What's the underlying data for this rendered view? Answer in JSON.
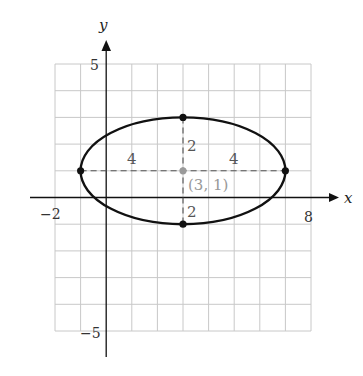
{
  "figure": {
    "type": "ellipse-on-grid",
    "axes": {
      "x_label": "x",
      "y_label": "y",
      "x_range": [
        -2,
        8
      ],
      "y_range": [
        -5,
        5
      ],
      "grid_step": 1
    },
    "tick_labels": {
      "x_min": "−2",
      "x_max": "8",
      "y_max": "5",
      "y_min": "−5"
    },
    "ellipse": {
      "center": [
        3,
        1
      ],
      "semi_major_horizontal": 4,
      "semi_minor_vertical": 2,
      "vertices": [
        [
          -1,
          1
        ],
        [
          7,
          1
        ]
      ],
      "co_vertices": [
        [
          3,
          3
        ],
        [
          3,
          -1
        ]
      ]
    },
    "annotations": {
      "center_label": "(3, 1)",
      "left_half_axis_label": "4",
      "right_half_axis_label": "4",
      "upper_half_axis_label": "2",
      "lower_half_axis_label": "2"
    },
    "colors": {
      "grid": "#c8c8c8",
      "axis": "#111111",
      "curve": "#111111",
      "center_point": "#9a9a9a",
      "center_label": "#999999"
    }
  }
}
